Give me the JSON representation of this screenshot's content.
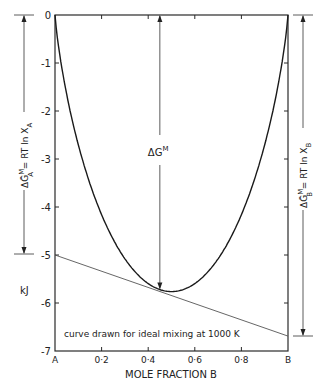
{
  "chart_data": {
    "type": "line",
    "title": "",
    "xlabel": "MOLE FRACTION B",
    "ylabel": "kJ",
    "xlim": [
      0,
      1
    ],
    "ylim": [
      -7,
      0
    ],
    "x_tick_labels": [
      "A",
      "0·2",
      "0·4",
      "0·6",
      "0·8",
      "B"
    ],
    "x_ticks": [
      0,
      0.2,
      0.4,
      0.6,
      0.8,
      1.0
    ],
    "y_tick_labels": [
      "0",
      "-1",
      "-2",
      "-3",
      "-4",
      "-5",
      "-6",
      "-7"
    ],
    "y_ticks": [
      0,
      -1,
      -2,
      -3,
      -4,
      -5,
      -6,
      -7
    ],
    "grid": false,
    "series": [
      {
        "name": "ΔG^M (ideal mixing, 1000 K)",
        "x": [
          0,
          0.05,
          0.1,
          0.15,
          0.2,
          0.25,
          0.3,
          0.35,
          0.4,
          0.45,
          0.5,
          0.55,
          0.6,
          0.65,
          0.7,
          0.75,
          0.8,
          0.85,
          0.9,
          0.95,
          1.0
        ],
        "y": [
          0,
          -1.65,
          -2.7,
          -3.53,
          -4.16,
          -4.68,
          -5.08,
          -5.4,
          -5.6,
          -5.73,
          -5.76,
          -5.73,
          -5.6,
          -5.4,
          -5.08,
          -4.68,
          -4.16,
          -3.53,
          -2.7,
          -1.65,
          0
        ]
      },
      {
        "name": "tangent",
        "x": [
          0,
          1
        ],
        "y": [
          -5.0,
          -6.69
        ]
      }
    ],
    "annotations": [
      {
        "text": "ΔG^M",
        "x": 0.45,
        "note": "vertical arrow from 0 down to curve at x≈0.45"
      },
      {
        "text": "ΔḠ^M_A = RT ln X_A",
        "side": "left",
        "value": -5.0
      },
      {
        "text": "ΔḠ^M_B = RT ln X_B",
        "side": "right",
        "value": -6.69
      },
      {
        "text": "curve drawn for ideal mixing at 1000 K"
      }
    ]
  },
  "labels": {
    "xlabel": "MOLE FRACTION B",
    "unit": "kJ",
    "note": "curve drawn for ideal mixing at 1000 K",
    "center_label_main": "ΔG",
    "center_label_sup": "M",
    "left_label": {
      "main": "ΔḠ",
      "sup": "M",
      "sub": "A",
      "rest": " = RT ln X",
      "rest_sub": "A"
    },
    "right_label": {
      "main": "ΔḠ",
      "sup": "M",
      "sub": "B",
      "rest": " = RT ln X",
      "rest_sub": "B"
    }
  },
  "colors": {
    "ink": "#222222",
    "tangent": "#555555",
    "background": "#ffffff"
  }
}
